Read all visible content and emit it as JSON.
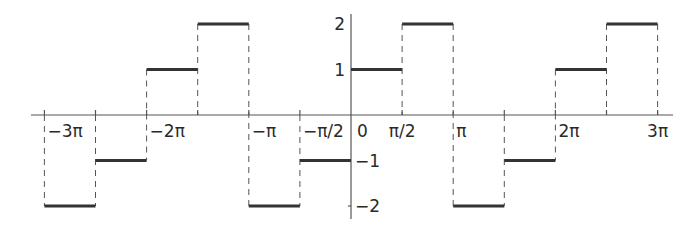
{
  "chart_data": {
    "type": "line",
    "subtype": "step-function (piecewise constant, discontinuous)",
    "title": "",
    "xlabel": "",
    "ylabel": "",
    "xlim": [
      -3.14159,
      3.14159
    ],
    "x_unit": "pi",
    "xlim_in_pi": [
      -3.1,
      3.2
    ],
    "ylim": [
      -2.2,
      2.2
    ],
    "grid": false,
    "legend": null,
    "x_ticks": [
      {
        "label": "−3π",
        "value_pi": -3
      },
      {
        "label": "−2π",
        "value_pi": -2
      },
      {
        "label": "−π",
        "value_pi": -1
      },
      {
        "label": "−π/2",
        "value_pi": -0.5
      },
      {
        "label": "0",
        "value_pi": 0
      },
      {
        "label": "π/2",
        "value_pi": 0.5
      },
      {
        "label": "π",
        "value_pi": 1
      },
      {
        "label": "2π",
        "value_pi": 2
      },
      {
        "label": "3π",
        "value_pi": 3
      }
    ],
    "y_ticks": [
      {
        "label": "2",
        "value": 2
      },
      {
        "label": "1",
        "value": 1
      },
      {
        "label": "−1",
        "value": -1
      },
      {
        "label": "−2",
        "value": -2
      }
    ],
    "segments": [
      {
        "x_start_pi": -3.0,
        "x_end_pi": -2.5,
        "y": -2
      },
      {
        "x_start_pi": -2.5,
        "x_end_pi": -2.0,
        "y": -1
      },
      {
        "x_start_pi": -2.0,
        "x_end_pi": -1.5,
        "y": 1
      },
      {
        "x_start_pi": -1.5,
        "x_end_pi": -1.0,
        "y": 2
      },
      {
        "x_start_pi": -1.0,
        "x_end_pi": -0.5,
        "y": -2
      },
      {
        "x_start_pi": -0.5,
        "x_end_pi": 0.0,
        "y": -1
      },
      {
        "x_start_pi": 0.0,
        "x_end_pi": 0.5,
        "y": 1
      },
      {
        "x_start_pi": 0.5,
        "x_end_pi": 1.0,
        "y": 2
      },
      {
        "x_start_pi": 1.0,
        "x_end_pi": 1.5,
        "y": -2
      },
      {
        "x_start_pi": 1.5,
        "x_end_pi": 2.0,
        "y": -1
      },
      {
        "x_start_pi": 2.0,
        "x_end_pi": 2.5,
        "y": 1
      },
      {
        "x_start_pi": 2.5,
        "x_end_pi": 3.0,
        "y": 2
      }
    ],
    "annotations": "Dashed vertical lines mark the jump discontinuities at every multiple of π/2",
    "colors": {
      "line": "#333333",
      "axis": "#555555",
      "guide": "#555555",
      "background": "#ffffff"
    }
  }
}
